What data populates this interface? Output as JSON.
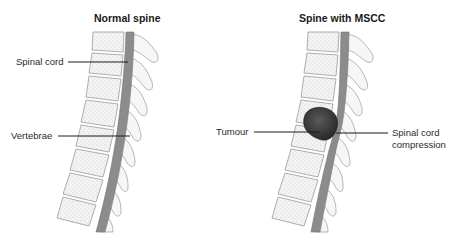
{
  "panels": [
    {
      "id": "normal",
      "title": "Normal spine",
      "labels": {
        "spinal_cord": "Spinal cord",
        "vertebrae": "Vertebrae"
      }
    },
    {
      "id": "mscc",
      "title": "Spine with MSCC",
      "labels": {
        "tumour": "Tumour",
        "compression_line1": "Spinal cord",
        "compression_line2": "compression"
      }
    }
  ],
  "colors": {
    "cord": "#8c8c8c",
    "bone_fill": "#f2f2f2",
    "bone_stroke": "#9a9a9a",
    "tumour": "#3a3a3a",
    "leader": "#1a1a1a"
  }
}
